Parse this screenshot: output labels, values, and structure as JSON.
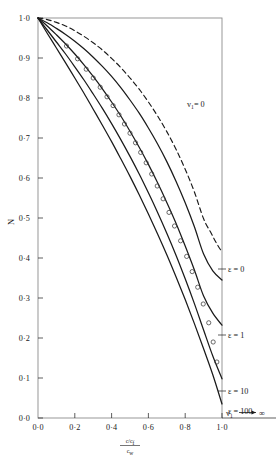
{
  "figure": {
    "name": "breakthrough-curve-plot",
    "axes": {
      "y": {
        "title": "N",
        "min": 0.0,
        "max": 1.0,
        "ticks": [
          0.0,
          0.1,
          0.2,
          0.3,
          0.4,
          0.5,
          0.6,
          0.7,
          0.8,
          0.9,
          1.0
        ],
        "tick_labels": [
          "0·0",
          "0·1",
          "0·2",
          "0·3",
          "0·4",
          "0·5",
          "0·6",
          "0·7",
          "0·8",
          "0·9",
          "1·0"
        ]
      },
      "x": {
        "title_numerator": "c/c",
        "title_num_sub": "f",
        "title_den": "c",
        "title_den_sub": "w",
        "min": 0.0,
        "max": 1.0,
        "ticks": [
          0.0,
          0.2,
          0.4,
          0.6,
          0.8,
          1.0
        ],
        "tick_labels": [
          "0·0",
          "0·2",
          "0·4",
          "0·6",
          "0·8",
          "1·0"
        ],
        "end_symbol": "∞",
        "end_var": "v",
        "end_var_sub": "1"
      }
    },
    "curve_labels": {
      "dashed": "v",
      "dashed_sub": "1",
      "dashed_value": "= 0",
      "eps0": "ε = 0",
      "eps1": "ε = 1",
      "eps10": "ε = 10",
      "eps100": "ε = 100"
    },
    "colors": {
      "ink": "#1a1a1a",
      "frame": "#8c8c8c",
      "background": "#ffffff"
    }
  },
  "chart_data": {
    "type": "line",
    "title": "",
    "xlabel": "c/c_f over c_w",
    "ylabel": "N",
    "xlim": [
      0.0,
      1.0
    ],
    "ylim": [
      0.0,
      1.0
    ],
    "grid": false,
    "legend": "inline-labels-right",
    "series": [
      {
        "name": "v1 = 0",
        "style": "dashed",
        "x": [
          0.0,
          0.05,
          0.1,
          0.15,
          0.2,
          0.25,
          0.3,
          0.35,
          0.4,
          0.45,
          0.5,
          0.55,
          0.6,
          0.65,
          0.7,
          0.75,
          0.8,
          0.85,
          0.9,
          0.94,
          0.97,
          1.0
        ],
        "y": [
          1.0,
          0.996,
          0.989,
          0.98,
          0.968,
          0.954,
          0.938,
          0.92,
          0.899,
          0.876,
          0.85,
          0.822,
          0.79,
          0.755,
          0.716,
          0.672,
          0.622,
          0.565,
          0.498,
          0.463,
          0.437,
          0.415
        ]
      },
      {
        "name": "ε = 0",
        "style": "solid",
        "x": [
          0.0,
          0.05,
          0.1,
          0.15,
          0.2,
          0.25,
          0.3,
          0.35,
          0.4,
          0.45,
          0.5,
          0.55,
          0.6,
          0.65,
          0.7,
          0.75,
          0.8,
          0.85,
          0.9,
          0.95,
          1.0
        ],
        "y": [
          1.0,
          0.988,
          0.974,
          0.959,
          0.942,
          0.923,
          0.902,
          0.879,
          0.854,
          0.826,
          0.795,
          0.762,
          0.725,
          0.685,
          0.641,
          0.592,
          0.538,
          0.478,
          0.41,
          0.368,
          0.345
        ]
      },
      {
        "name": "ε = 1",
        "style": "solid",
        "x": [
          0.0,
          0.05,
          0.1,
          0.15,
          0.2,
          0.25,
          0.3,
          0.35,
          0.4,
          0.45,
          0.5,
          0.55,
          0.6,
          0.65,
          0.7,
          0.75,
          0.8,
          0.85,
          0.9,
          0.95,
          1.0
        ],
        "y": [
          1.0,
          0.98,
          0.958,
          0.935,
          0.91,
          0.883,
          0.854,
          0.823,
          0.79,
          0.755,
          0.717,
          0.677,
          0.634,
          0.588,
          0.539,
          0.487,
          0.43,
          0.37,
          0.305,
          0.262,
          0.232
        ]
      },
      {
        "name": "ε = 10",
        "style": "solid",
        "x": [
          0.0,
          0.05,
          0.1,
          0.15,
          0.2,
          0.25,
          0.3,
          0.35,
          0.4,
          0.45,
          0.5,
          0.55,
          0.6,
          0.65,
          0.7,
          0.75,
          0.8,
          0.85,
          0.9,
          0.95,
          1.0
        ],
        "y": [
          1.0,
          0.97,
          0.94,
          0.91,
          0.878,
          0.845,
          0.81,
          0.774,
          0.736,
          0.696,
          0.654,
          0.61,
          0.563,
          0.514,
          0.462,
          0.407,
          0.348,
          0.286,
          0.22,
          0.155,
          0.098
        ]
      },
      {
        "name": "ε = 100",
        "style": "solid",
        "x": [
          0.0,
          0.05,
          0.1,
          0.15,
          0.2,
          0.25,
          0.3,
          0.35,
          0.4,
          0.45,
          0.5,
          0.55,
          0.6,
          0.65,
          0.7,
          0.75,
          0.8,
          0.85,
          0.9,
          0.95,
          1.0
        ],
        "y": [
          1.0,
          0.962,
          0.925,
          0.888,
          0.85,
          0.812,
          0.772,
          0.732,
          0.691,
          0.648,
          0.604,
          0.558,
          0.51,
          0.46,
          0.408,
          0.353,
          0.296,
          0.236,
          0.173,
          0.108,
          0.035
        ]
      },
      {
        "name": "experimental data",
        "style": "open-circles",
        "x": [
          0.155,
          0.215,
          0.262,
          0.3,
          0.338,
          0.375,
          0.408,
          0.44,
          0.47,
          0.5,
          0.53,
          0.558,
          0.588,
          0.618,
          0.648,
          0.68,
          0.712,
          0.742,
          0.775,
          0.808,
          0.838,
          0.868,
          0.898,
          0.928,
          0.952,
          0.972
        ],
        "y": [
          0.93,
          0.898,
          0.872,
          0.85,
          0.827,
          0.803,
          0.781,
          0.758,
          0.735,
          0.712,
          0.688,
          0.664,
          0.638,
          0.61,
          0.58,
          0.548,
          0.514,
          0.48,
          0.443,
          0.404,
          0.366,
          0.327,
          0.285,
          0.238,
          0.19,
          0.14
        ]
      }
    ]
  }
}
